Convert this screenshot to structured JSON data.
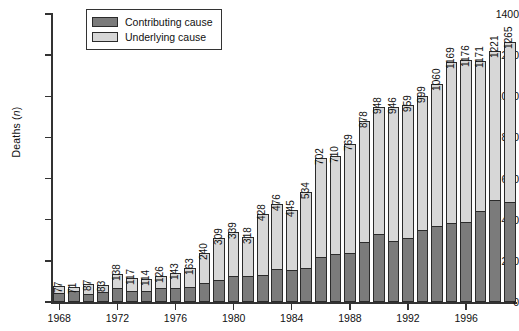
{
  "chart_data": {
    "type": "bar",
    "title": "",
    "subtitle": "",
    "stacked": true,
    "xlabel": "",
    "ylabel": "Deaths (n)",
    "ylim": [
      0,
      1400
    ],
    "ytick_labels": [
      "0",
      "200",
      "400",
      "600",
      "800",
      "1000",
      "1200",
      "1400"
    ],
    "ytick_values": [
      0,
      200,
      400,
      600,
      800,
      1000,
      1200,
      1400
    ],
    "grid": false,
    "legend_position": "top-left",
    "categories": [
      "1968",
      "1969",
      "1970",
      "1971",
      "1972",
      "1973",
      "1974",
      "1975",
      "1976",
      "1977",
      "1978",
      "1979",
      "1980",
      "1981",
      "1982",
      "1983",
      "1984",
      "1985",
      "1986",
      "1987",
      "1988",
      "1989",
      "1990",
      "1991",
      "1992",
      "1993",
      "1994",
      "1995",
      "1996",
      "1997",
      "1998",
      "1999"
    ],
    "xtick_labels": [
      "1968",
      "1972",
      "1976",
      "1980",
      "1984",
      "1988",
      "1992",
      "1996"
    ],
    "xtick_categories": [
      "1968",
      "1972",
      "1976",
      "1980",
      "1984",
      "1988",
      "1992",
      "1996"
    ],
    "series": [
      {
        "name": "Contributing cause",
        "color": "#7b7b7b",
        "values": [
          40,
          47,
          33,
          46,
          62,
          51,
          51,
          61,
          65,
          70,
          89,
          101,
          122,
          122,
          124,
          157,
          150,
          158,
          216,
          229,
          232,
          289,
          328,
          293,
          304,
          344,
          363,
          378,
          386,
          437,
          489,
          479
        ]
      },
      {
        "name": "Underlying cause",
        "color": "#d7d7d7",
        "values": [
          37,
          24,
          54,
          37,
          76,
          66,
          63,
          65,
          78,
          93,
          151,
          208,
          217,
          196,
          304,
          319,
          295,
          376,
          486,
          481,
          537,
          589,
          620,
          653,
          655,
          655,
          697,
          791,
          790,
          734,
          732,
          786
        ]
      }
    ],
    "totals": [
      77,
      71,
      87,
      83,
      138,
      117,
      114,
      126,
      143,
      163,
      240,
      309,
      339,
      318,
      428,
      476,
      445,
      534,
      702,
      710,
      769,
      878,
      948,
      946,
      959,
      999,
      1060,
      1169,
      1176,
      1171,
      1221,
      1265
    ],
    "value_labels": [
      "77",
      "71",
      "87",
      "83",
      "138",
      "117",
      "114",
      "126",
      "143",
      "163",
      "240",
      "309",
      "339",
      "318",
      "428",
      "476",
      "445",
      "534",
      "702",
      "710",
      "769",
      "878",
      "948",
      "946",
      "959",
      "999",
      "1060",
      "1169",
      "1176",
      "1171",
      "1221",
      "1265"
    ]
  },
  "legend": {
    "items": [
      {
        "label": "Contributing cause",
        "swatch": "contrib"
      },
      {
        "label": "Underlying cause",
        "swatch": "under"
      }
    ]
  },
  "axis": {
    "y_label_text": "Deaths (",
    "y_label_italic": "n",
    "y_label_tail": ")"
  }
}
